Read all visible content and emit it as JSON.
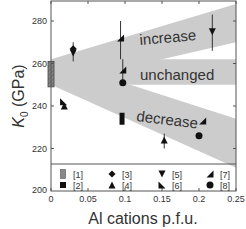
{
  "chart_data": {
    "type": "scatter",
    "title": "",
    "xlabel": "Al cations p.f.u.",
    "ylabel": "K0 (GPa)",
    "ylabel_main": "K",
    "ylabel_sub": "0",
    "ylabel_unit": " (GPa)",
    "xlim": [
      0,
      0.25
    ],
    "ylim": [
      200,
      290
    ],
    "xticks": [
      "0",
      "0.05",
      "0.1",
      "0.15",
      "0.2",
      "0.25"
    ],
    "xtick_values": [
      0,
      0.05,
      0.1,
      0.15,
      0.2,
      0.25
    ],
    "yticks": [
      "200",
      "220",
      "240",
      "260",
      "280"
    ],
    "ytick_values": [
      200,
      220,
      240,
      260,
      280
    ],
    "grid": false,
    "bands": [
      {
        "label": "increase",
        "x": [
          0,
          0.25
        ],
        "lower": [
          250,
          270
        ],
        "upper": [
          262,
          288
        ]
      },
      {
        "label": "unchanged",
        "x": [
          0,
          0.25
        ],
        "lower": [
          250,
          250
        ],
        "upper": [
          262,
          262
        ]
      },
      {
        "label": "decrease",
        "x": [
          0,
          0.25
        ],
        "lower": [
          250,
          211
        ],
        "upper": [
          262,
          234
        ]
      }
    ],
    "series": [
      {
        "name": "[1]",
        "marker": "hatched-bar",
        "points": [
          {
            "x": 0,
            "y_low": 249,
            "y_high": 261
          }
        ]
      },
      {
        "name": "[2]",
        "marker": "square",
        "points": [
          {
            "x": 0.096,
            "y": 234,
            "err_low": 232,
            "err_high": 236
          }
        ]
      },
      {
        "name": "[3]",
        "marker": "diamond",
        "points": [
          {
            "x": 0.03,
            "y": 267,
            "err_low": 261,
            "err_high": 270
          }
        ]
      },
      {
        "name": "[4]",
        "marker": "triangle-up",
        "points": [
          {
            "x": 0.018,
            "y": 240
          },
          {
            "x": 0.153,
            "y": 224,
            "err_low": 220,
            "err_high": 227
          }
        ]
      },
      {
        "name": "[5]",
        "marker": "triangle-down",
        "points": [
          {
            "x": 0.03,
            "y": 265
          },
          {
            "x": 0.218,
            "y": 275,
            "err_low": 266,
            "err_high": 283
          }
        ]
      },
      {
        "name": "[6]",
        "marker": "triangle-right-corner",
        "points": [
          {
            "x": 0.017,
            "y": 242
          }
        ]
      },
      {
        "name": "[7]",
        "marker": "triangle-left-corner",
        "points": [
          {
            "x": 0.094,
            "y": 272,
            "err_low": 262,
            "err_high": 280
          },
          {
            "x": 0.097,
            "y": 257,
            "err_low": 251,
            "err_high": 262
          },
          {
            "x": 0.205,
            "y": 233
          }
        ]
      },
      {
        "name": "[8]",
        "marker": "circle",
        "points": [
          {
            "x": 0.097,
            "y": 251
          },
          {
            "x": 0.2,
            "y": 226
          }
        ]
      }
    ],
    "legend": {
      "position": "bottom-inside",
      "entries": [
        "[1]",
        "[2]",
        "[3]",
        "[4]",
        "[5]",
        "[6]",
        "[7]",
        "[8]"
      ]
    },
    "annotations": [
      "increase",
      "unchanged",
      "decrease"
    ]
  },
  "colors": {
    "band": "#cccccc",
    "axis": "#555555",
    "marker": "#111111",
    "bar1": "#888888"
  }
}
